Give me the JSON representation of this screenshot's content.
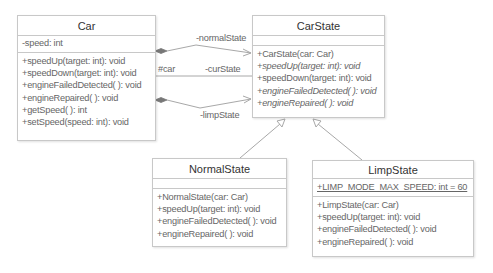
{
  "classes": {
    "car": {
      "name": "Car",
      "attributes": [
        "-speed: int"
      ],
      "operations": [
        "+speedUp(target: int): void",
        "+speedDown(target: int): void",
        "+engineFailedDetected( ): void",
        "+engineRepaired( ): void",
        "+getSpeed( ): int",
        "+setSpeed(speed: int): void"
      ]
    },
    "carState": {
      "name": "CarState",
      "attributes": [],
      "operations": [
        "+CarState(car: Car)",
        "+speedUp(target: int): void",
        "+speedDown(target: int): void",
        "+engineFailedDetected( ): void",
        "+engineRepaired( ): void"
      ],
      "abstract_operations": [
        1,
        3,
        4
      ]
    },
    "normalState": {
      "name": "NormalState",
      "attributes": [],
      "operations": [
        "+NormalState(car: Car)",
        "+speedUp(target: int): void",
        "+engineFailedDetected( ): void",
        "+engineRepaired( ): void"
      ]
    },
    "limpState": {
      "name": "LimpState",
      "attributes": [
        "+LIMP_MODE_MAX_SPEED: int = 60"
      ],
      "static_attributes": [
        0
      ],
      "operations": [
        "+LimpState(car: Car)",
        "+speedUp(target: int): void",
        "+engineFailedDetected( ): void",
        "+engineRepaired( ): void"
      ]
    }
  },
  "associations": {
    "normalState": {
      "label": "-normalState",
      "type": "composition"
    },
    "curState": {
      "label": "-curState",
      "source_label": "#car",
      "type": "association"
    },
    "limpState": {
      "label": "-limpState",
      "type": "composition"
    }
  },
  "generalizations": [
    {
      "from": "NormalState",
      "to": "CarState"
    },
    {
      "from": "LimpState",
      "to": "CarState"
    }
  ],
  "colors": {
    "line": "#a8a8a8",
    "border": "#c8c8c8",
    "text": "#666666",
    "diamond": "#777777"
  }
}
